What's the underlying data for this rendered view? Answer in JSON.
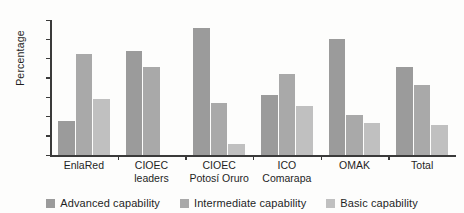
{
  "chart_data": {
    "type": "bar",
    "title": "",
    "xlabel": "",
    "ylabel": "Percentage",
    "ylim": [
      0,
      70
    ],
    "yticks": [
      0,
      10,
      20,
      30,
      40,
      50,
      60,
      70
    ],
    "grid": false,
    "legend_position": "bottom",
    "categories": [
      "EnlaRed",
      "CIOEC\nleaders",
      "CIOEC\nPotosí Oruro",
      "ICO\nComarapa",
      "OMAK",
      "Total"
    ],
    "series": [
      {
        "name": "Advanced capability",
        "color": "#9b9b9b",
        "values": [
          17.5,
          54,
          66,
          31,
          60,
          45.5
        ]
      },
      {
        "name": "Intermediate capability",
        "color": "#a9a9a9",
        "values": [
          52.5,
          45.5,
          27,
          42,
          21,
          36.5
        ]
      },
      {
        "name": "Basic capability",
        "color": "#c0c0c0",
        "values": [
          29,
          0,
          5.5,
          25.5,
          16.5,
          15.5
        ]
      }
    ]
  }
}
